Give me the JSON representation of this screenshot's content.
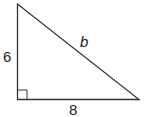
{
  "diagram": {
    "type": "right-triangle",
    "labels": {
      "vertical_leg": "6",
      "horizontal_leg": "8",
      "hypotenuse": "b"
    },
    "right_angle_marker": true,
    "colors": {
      "stroke": "#333333",
      "background": "#ffffff"
    }
  }
}
